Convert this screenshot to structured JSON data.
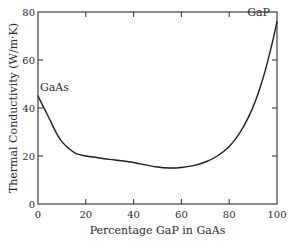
{
  "chart_data": {
    "type": "line",
    "title": "",
    "xlabel": "Percentage GaP in GaAs",
    "ylabel": "Thermal Conductivity (W/m·K)",
    "xlim": [
      0,
      100
    ],
    "ylim": [
      0,
      80
    ],
    "xticks": [
      0,
      20,
      40,
      60,
      80,
      100
    ],
    "yticks": [
      0,
      20,
      40,
      60,
      80
    ],
    "grid": false,
    "legend": null,
    "series": [
      {
        "name": "GaAs1-xPx thermal conductivity",
        "x": [
          0,
          2,
          5,
          8,
          10,
          13,
          16,
          20,
          25,
          30,
          35,
          40,
          45,
          50,
          55,
          60,
          65,
          70,
          75,
          80,
          84,
          88,
          91,
          94,
          96,
          98,
          100
        ],
        "y": [
          45,
          41,
          35,
          29,
          26,
          23,
          21,
          20,
          19.3,
          18.6,
          18,
          17.3,
          16.3,
          15.4,
          15,
          15.2,
          16,
          17.5,
          20,
          24,
          29,
          36,
          43,
          52,
          59,
          67,
          76
        ]
      }
    ],
    "annotations": [
      {
        "text": "GaAs",
        "x": 0,
        "y": 45
      },
      {
        "text": "GaP",
        "x": 100,
        "y": 76
      }
    ]
  }
}
